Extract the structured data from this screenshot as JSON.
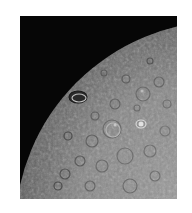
{
  "image": {
    "subject": "cratered planetary surface near limb",
    "background_color": "#ffffff",
    "sky_color": "#060606",
    "surface_color": "#8a8a8a"
  }
}
